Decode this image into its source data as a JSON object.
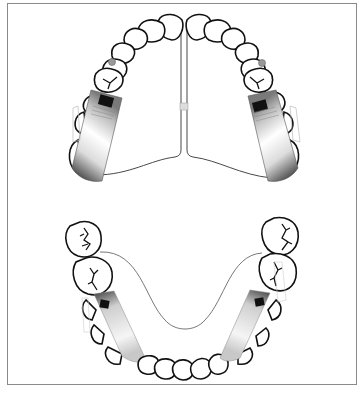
{
  "figure": {
    "type": "dental-diagram",
    "colors": {
      "outline": "#111111",
      "frame": "#8a8a8a",
      "appliance_dark": "#1a1a1a",
      "appliance_light": "#ffffff",
      "bracket": "#000000",
      "hook": "#b0b0b0"
    }
  },
  "upper_arch": {
    "name": "maxillary-arch",
    "midline_wire": "palatal-split-wire",
    "appliances": [
      {
        "side": "left",
        "component": "appliance-block",
        "bracket": "rectangular-attachment"
      },
      {
        "side": "right",
        "component": "appliance-block",
        "bracket": "rectangular-attachment"
      }
    ],
    "connector": "transpalatal-wire"
  },
  "lower_arch": {
    "name": "mandibular-arch",
    "appliances": [
      {
        "side": "left",
        "component": "appliance-block",
        "bracket": "rectangular-attachment"
      },
      {
        "side": "right",
        "component": "appliance-block",
        "bracket": "rectangular-attachment"
      }
    ],
    "connector": "lingual-arch-wire"
  }
}
